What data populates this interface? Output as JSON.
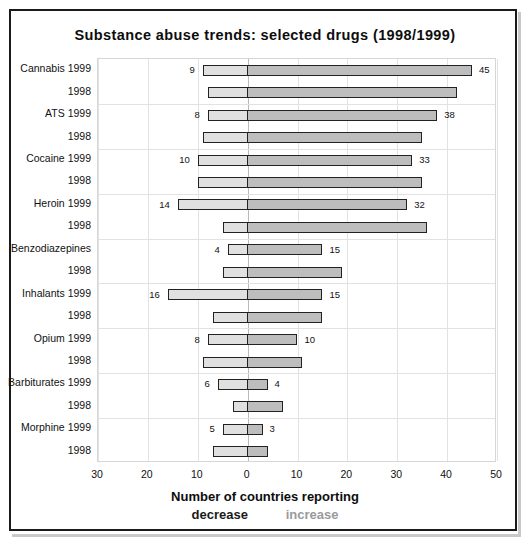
{
  "chart_data": {
    "type": "bar",
    "subtype": "diverging-horizontal",
    "title": "Substance abuse trends: selected drugs (1998/1999)",
    "xlabel": "Number of countries reporting",
    "ylabel": "",
    "xlim": [
      -30,
      50
    ],
    "xticks": [
      -30,
      -20,
      -10,
      0,
      10,
      20,
      30,
      40,
      50
    ],
    "xtick_labels": [
      "30",
      "20",
      "10",
      "0",
      "10",
      "20",
      "30",
      "40",
      "50"
    ],
    "grid": true,
    "legend_position": "below-axis",
    "legend": [
      {
        "label": "decrease",
        "color": "#e0e0e0",
        "side": "negative"
      },
      {
        "label": "increase",
        "color": "#bdbdbd",
        "side": "positive"
      }
    ],
    "note": "Negative (left) segment = countries reporting decrease; positive (right) segment = countries reporting increase.",
    "groups": [
      {
        "drug": "Cannabis",
        "rows": [
          {
            "label": "Cannabis 1999",
            "year": "1999",
            "decrease": 9,
            "increase": 45,
            "decrease_label": "9",
            "increase_label": "45"
          },
          {
            "label": "1998",
            "year": "1998",
            "decrease": 8,
            "increase": 42,
            "decrease_label": "",
            "increase_label": ""
          }
        ]
      },
      {
        "drug": "ATS",
        "rows": [
          {
            "label": "ATS 1999",
            "year": "1999",
            "decrease": 8,
            "increase": 38,
            "decrease_label": "8",
            "increase_label": "38"
          },
          {
            "label": "1998",
            "year": "1998",
            "decrease": 9,
            "increase": 35,
            "decrease_label": "",
            "increase_label": ""
          }
        ]
      },
      {
        "drug": "Cocaine",
        "rows": [
          {
            "label": "Cocaine 1999",
            "year": "1999",
            "decrease": 10,
            "increase": 33,
            "decrease_label": "10",
            "increase_label": "33"
          },
          {
            "label": "1998",
            "year": "1998",
            "decrease": 10,
            "increase": 35,
            "decrease_label": "",
            "increase_label": ""
          }
        ]
      },
      {
        "drug": "Heroin",
        "rows": [
          {
            "label": "Heroin 1999",
            "year": "1999",
            "decrease": 14,
            "increase": 32,
            "decrease_label": "14",
            "increase_label": "32"
          },
          {
            "label": "1998",
            "year": "1998",
            "decrease": 5,
            "increase": 36,
            "decrease_label": "",
            "increase_label": ""
          }
        ]
      },
      {
        "drug": "Benzodiazepines",
        "rows": [
          {
            "label": "Benzodiazepines",
            "year": "1999",
            "decrease": 4,
            "increase": 15,
            "decrease_label": "4",
            "increase_label": "15"
          },
          {
            "label": "1998",
            "year": "1998",
            "decrease": 5,
            "increase": 19,
            "decrease_label": "",
            "increase_label": ""
          }
        ]
      },
      {
        "drug": "Inhalants",
        "rows": [
          {
            "label": "Inhalants 1999",
            "year": "1999",
            "decrease": 16,
            "increase": 15,
            "decrease_label": "16",
            "increase_label": "15"
          },
          {
            "label": "1998",
            "year": "1998",
            "decrease": 7,
            "increase": 15,
            "decrease_label": "",
            "increase_label": ""
          }
        ]
      },
      {
        "drug": "Opium",
        "rows": [
          {
            "label": "Opium 1999",
            "year": "1999",
            "decrease": 8,
            "increase": 10,
            "decrease_label": "8",
            "increase_label": "10"
          },
          {
            "label": "1998",
            "year": "1998",
            "decrease": 9,
            "increase": 11,
            "decrease_label": "",
            "increase_label": ""
          }
        ]
      },
      {
        "drug": "Barbiturates",
        "rows": [
          {
            "label": "Barbiturates 1999",
            "year": "1999",
            "decrease": 6,
            "increase": 4,
            "decrease_label": "6",
            "increase_label": "4"
          },
          {
            "label": "1998",
            "year": "1998",
            "decrease": 3,
            "increase": 7,
            "decrease_label": "",
            "increase_label": ""
          }
        ]
      },
      {
        "drug": "Morphine",
        "rows": [
          {
            "label": "Morphine 1999",
            "year": "1999",
            "decrease": 5,
            "increase": 3,
            "decrease_label": "5",
            "increase_label": "3"
          },
          {
            "label": "1998",
            "year": "1998",
            "decrease": 7,
            "increase": 4,
            "decrease_label": "",
            "increase_label": ""
          }
        ]
      }
    ]
  },
  "colors": {
    "decrease_fill": "#e0e0e0",
    "increase_fill": "#bdbdbd",
    "bar_outline": "#222222",
    "grid": "#e2e2e2",
    "zero_line": "#b9b9b9",
    "frame": "#1a1a1a",
    "legend_increase_text": "#9a9a9a"
  }
}
